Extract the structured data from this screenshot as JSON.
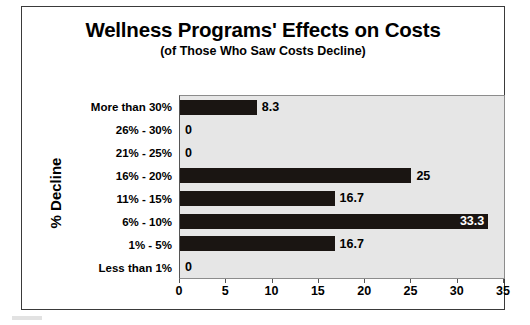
{
  "chart_data": {
    "type": "bar",
    "orientation": "horizontal",
    "title": "Wellness Programs' Effects on Costs",
    "subtitle": "(of Those Who Saw Costs Decline)",
    "xlabel": "",
    "ylabel": "% Decline",
    "xlim": [
      0,
      35
    ],
    "xticks": [
      "0",
      "5",
      "10",
      "15",
      "20",
      "25",
      "30",
      "35"
    ],
    "grid": false,
    "legend": false,
    "bar_color": "#1a1512",
    "plot_background": "#e6e6e6",
    "categories": [
      "More than 30%",
      "26% - 30%",
      "21% - 25%",
      "16% - 20%",
      "11% - 15%",
      "6% - 10%",
      "1% - 5%",
      "Less than 1%"
    ],
    "values": [
      8.3,
      0,
      0,
      25,
      16.7,
      33.3,
      16.7,
      0
    ],
    "value_labels": [
      "8.3",
      "0",
      "0",
      "25",
      "16.7",
      "33.3",
      "16.7",
      "0"
    ],
    "label_placement": [
      "outside",
      "outside",
      "outside",
      "outside",
      "outside",
      "inside",
      "outside",
      "outside"
    ]
  }
}
